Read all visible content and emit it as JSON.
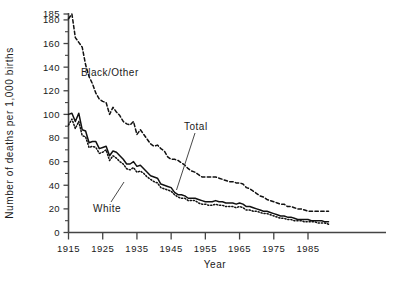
{
  "chart_data": {
    "type": "line",
    "title": "",
    "xlabel": "Year",
    "ylabel": "Number of deaths per 1,000 births",
    "xlim": [
      1915,
      1991
    ],
    "ylim": [
      0,
      185
    ],
    "grid": false,
    "legend_position": "inline-annotations",
    "xticks": [
      1915,
      1925,
      1935,
      1945,
      1955,
      1965,
      1975,
      1985
    ],
    "xtick_labels": [
      "1915",
      "1925",
      "1935",
      "1945",
      "1955",
      "1965",
      "1975",
      "1985"
    ],
    "yticks": [
      0,
      20,
      40,
      60,
      80,
      100,
      120,
      140,
      160,
      180,
      185
    ],
    "ytick_labels": [
      "0",
      "20",
      "40",
      "60",
      "80",
      "100",
      "120",
      "140",
      "160",
      "180",
      "185"
    ],
    "yminor_ticks": [
      10,
      30,
      50,
      70,
      90,
      110,
      130,
      150,
      170
    ],
    "x": [
      1915,
      1916,
      1917,
      1918,
      1919,
      1920,
      1921,
      1922,
      1923,
      1924,
      1925,
      1926,
      1927,
      1928,
      1929,
      1930,
      1931,
      1932,
      1933,
      1934,
      1935,
      1936,
      1937,
      1938,
      1939,
      1940,
      1941,
      1942,
      1943,
      1944,
      1945,
      1946,
      1947,
      1948,
      1949,
      1950,
      1951,
      1952,
      1953,
      1954,
      1955,
      1956,
      1957,
      1958,
      1959,
      1960,
      1961,
      1962,
      1963,
      1964,
      1965,
      1966,
      1967,
      1968,
      1969,
      1970,
      1971,
      1972,
      1973,
      1974,
      1975,
      1976,
      1977,
      1978,
      1979,
      1980,
      1981,
      1982,
      1983,
      1984,
      1985,
      1986,
      1987,
      1988,
      1989,
      1990,
      1991
    ],
    "series": [
      {
        "name": "Black/Other",
        "style": "dashed",
        "annotation": "Black/Other",
        "values": [
          181,
          185,
          165,
          161,
          157,
          142,
          132,
          126,
          118,
          113,
          111,
          110,
          100,
          106,
          102,
          99,
          94,
          92,
          91,
          94,
          83,
          87,
          83,
          79,
          75,
          73,
          74,
          71,
          69,
          64,
          62,
          62,
          61,
          59,
          57,
          54,
          52,
          51,
          49,
          47,
          47,
          47,
          47,
          47,
          46,
          45,
          44,
          43,
          43,
          42,
          42,
          41,
          38,
          37,
          35,
          33,
          31,
          30,
          28,
          27,
          26,
          25,
          24,
          24,
          22,
          22,
          21,
          20,
          20,
          19,
          18,
          18,
          18,
          18,
          18,
          18,
          18
        ]
      },
      {
        "name": "Total",
        "style": "solid",
        "annotation": "Total",
        "values": [
          100,
          101,
          94,
          101,
          87,
          86,
          76,
          77,
          77,
          71,
          72,
          73,
          65,
          69,
          68,
          65,
          62,
          58,
          58,
          60,
          56,
          57,
          54,
          51,
          48,
          47,
          46,
          41,
          40,
          39,
          38,
          34,
          32,
          32,
          31,
          29,
          29,
          29,
          28,
          27,
          26,
          26,
          26,
          27,
          26,
          26,
          25,
          25,
          25,
          24,
          25,
          24,
          22,
          22,
          21,
          20,
          19,
          18,
          18,
          17,
          16,
          15,
          14,
          14,
          13,
          13,
          12,
          11,
          11,
          11,
          11,
          10,
          10,
          10,
          10,
          9,
          9
        ]
      },
      {
        "name": "White",
        "style": "dotted",
        "annotation": "White",
        "values": [
          91,
          96,
          88,
          94,
          82,
          81,
          72,
          73,
          72,
          67,
          68,
          70,
          61,
          65,
          63,
          60,
          58,
          54,
          53,
          55,
          51,
          52,
          50,
          47,
          45,
          43,
          42,
          38,
          37,
          36,
          35,
          32,
          30,
          29,
          29,
          27,
          27,
          27,
          25,
          24,
          24,
          23,
          23,
          24,
          23,
          23,
          22,
          22,
          22,
          21,
          22,
          21,
          19,
          19,
          18,
          18,
          17,
          16,
          16,
          15,
          14,
          13,
          12,
          12,
          11,
          11,
          10,
          10,
          10,
          9,
          9,
          9,
          9,
          8,
          8,
          8,
          7
        ]
      }
    ]
  },
  "labels": {
    "y_axis_title": "Number of deaths per 1,000 births",
    "x_axis_title": "Year",
    "series_black_other": "Black/Other",
    "series_total": "Total",
    "series_white": "White"
  }
}
